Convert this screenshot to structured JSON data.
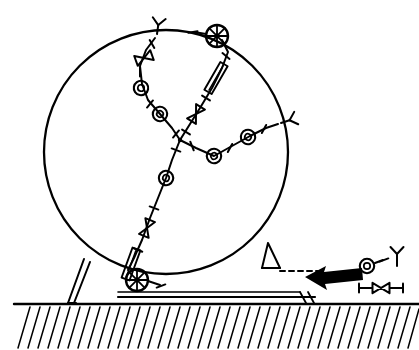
{
  "figure": {
    "type": "line-art technical diagram",
    "background_color": "#ffffff",
    "ink_color": "#000000",
    "canvas": {
      "width": 419,
      "height": 350
    }
  },
  "body": {
    "name": "large-circle",
    "shape": "circle",
    "cx": 166,
    "cy": 152,
    "r": 122,
    "stroke_width": 2.2
  },
  "ground": {
    "name": "hatched-ground",
    "surface_y": 304,
    "x_start": 14,
    "x_end": 419,
    "hatch_count": 41,
    "hatch_angle_label": "down-left diagonal",
    "hatch_depth": 44
  },
  "supports": [
    {
      "name": "left-strut",
      "label": "left support leg"
    },
    {
      "name": "right-foot",
      "label": "right support foot"
    },
    {
      "name": "base-rail",
      "label": "horizontal base rail"
    }
  ],
  "arrow": {
    "name": "force-arrow",
    "direction": "left",
    "style": "solid black block arrow",
    "tip_x": 305,
    "tail_x": 360,
    "y": 277
  },
  "chains": [
    {
      "name": "chain-upper-left",
      "description": "upper-left branch from center junction to Y-fork terminator",
      "node_count": 2,
      "elements": [
        "ring",
        "ring",
        "bowtie",
        "y-fork"
      ]
    },
    {
      "name": "chain-upper-right",
      "description": "upper-right branch from center junction to spoked wheel",
      "node_count": 1,
      "elements": [
        "bowtie",
        "rod",
        "spoked-wheel"
      ]
    },
    {
      "name": "chain-right",
      "description": "right branch from center junction to Y-fork terminator",
      "node_count": 2,
      "elements": [
        "ring",
        "ring",
        "y-fork"
      ]
    },
    {
      "name": "chain-lower-left",
      "description": "lower-left branch from center junction to spoked wheel at contact point",
      "node_count": 2,
      "elements": [
        "ring",
        "ring",
        "bowtie",
        "rod",
        "spoked-wheel"
      ]
    }
  ],
  "junction": {
    "name": "center-junction",
    "x": 180,
    "y": 140,
    "label": "four-way branch point"
  },
  "legend": {
    "name": "symbol-legend",
    "position": "right side, above ground",
    "items": [
      {
        "name": "ring-symbol",
        "glyph": "ring",
        "x": 367,
        "y": 266
      },
      {
        "name": "y-fork-symbol",
        "glyph": "y-fork",
        "x": 397,
        "y": 254
      },
      {
        "name": "bowtie-symbol",
        "glyph": "bowtie",
        "x": 380,
        "y": 288
      }
    ]
  },
  "dashed_guides": [
    {
      "name": "upper-dashed-line",
      "label": "dashed guide from right foot",
      "y": 271
    },
    {
      "name": "lower-dashed-line",
      "label": "dashed base guide",
      "y": 297
    }
  ]
}
